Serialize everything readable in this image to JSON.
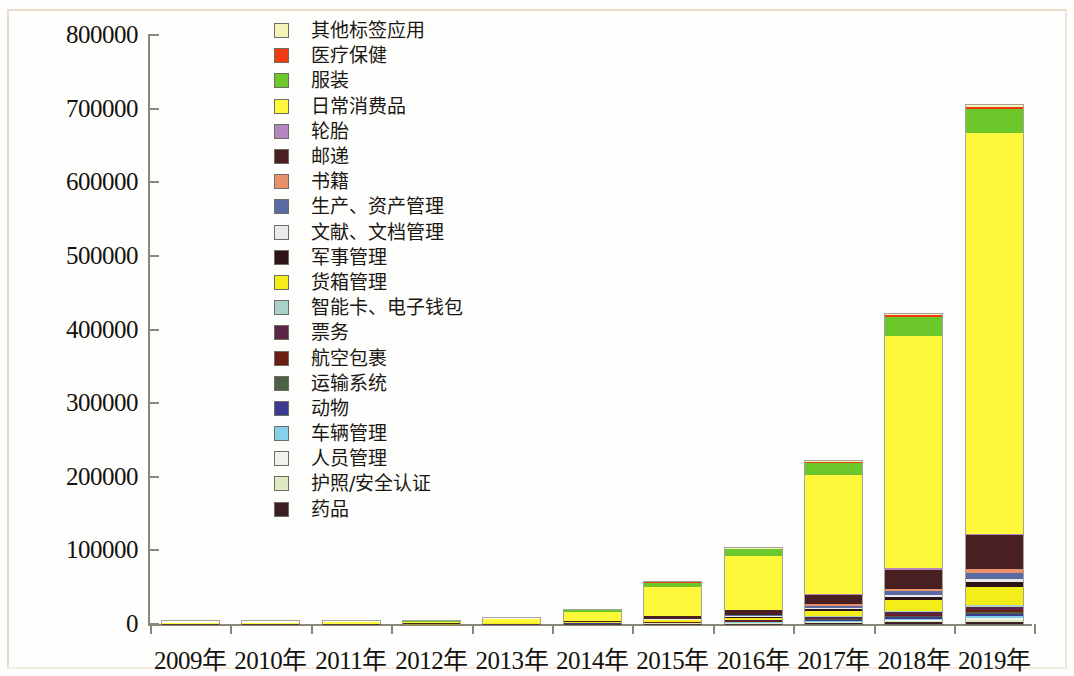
{
  "chart_data": {
    "type": "bar",
    "stacked": true,
    "title": "",
    "subtitle": "",
    "xlabel": "",
    "ylabel": "",
    "ylim": [
      0,
      800000
    ],
    "ytick_labels": [
      "0",
      "100000",
      "200000",
      "300000",
      "400000",
      "500000",
      "600000",
      "700000",
      "800000"
    ],
    "ytick_values": [
      0,
      100000,
      200000,
      300000,
      400000,
      500000,
      600000,
      700000,
      800000
    ],
    "grid": false,
    "legend_position": "inside-top-left",
    "categories": [
      "2009年",
      "2010年",
      "2011年",
      "2012年",
      "2013年",
      "2014年",
      "2015年",
      "2016年",
      "2017年",
      "2018年",
      "2019年"
    ],
    "totals": [
      2000,
      2300,
      3000,
      4200,
      7500,
      19000,
      57000,
      103000,
      221000,
      421000,
      705000
    ],
    "series": [
      {
        "name": "药品",
        "color": "#3b1f22",
        "values": [
          20,
          25,
          30,
          45,
          80,
          200,
          420,
          700,
          1300,
          2200,
          3200
        ]
      },
      {
        "name": "护照/安全认证",
        "color": "#dfe9c4",
        "values": [
          15,
          18,
          24,
          36,
          65,
          160,
          330,
          560,
          1050,
          1800,
          2600
        ]
      },
      {
        "name": "人员管理",
        "color": "#f2f2ec",
        "values": [
          15,
          18,
          24,
          36,
          65,
          160,
          330,
          560,
          1050,
          1800,
          2600
        ]
      },
      {
        "name": "车辆管理",
        "color": "#84d2ea",
        "values": [
          15,
          18,
          24,
          36,
          65,
          160,
          330,
          560,
          1050,
          1800,
          2600
        ]
      },
      {
        "name": "动物",
        "color": "#3b3a8f",
        "values": [
          15,
          18,
          24,
          36,
          65,
          160,
          330,
          560,
          1050,
          1800,
          2600
        ]
      },
      {
        "name": "运输系统",
        "color": "#4c6047",
        "values": [
          15,
          18,
          24,
          36,
          65,
          160,
          330,
          560,
          1050,
          1800,
          2600
        ]
      },
      {
        "name": "航空包裹",
        "color": "#6e1d12",
        "values": [
          15,
          18,
          24,
          36,
          65,
          160,
          330,
          560,
          1050,
          1800,
          2600
        ]
      },
      {
        "name": "票务",
        "color": "#5c2447",
        "values": [
          25,
          30,
          40,
          60,
          110,
          280,
          560,
          950,
          1900,
          3400,
          5200
        ]
      },
      {
        "name": "智能卡、电子钱包",
        "color": "#a9d2cb",
        "values": [
          15,
          18,
          24,
          36,
          65,
          160,
          330,
          560,
          1050,
          1800,
          2600
        ]
      },
      {
        "name": "货箱管理",
        "color": "#f3ee1a",
        "values": [
          60,
          70,
          95,
          140,
          260,
          650,
          1900,
          3500,
          7600,
          14500,
          24000
        ]
      },
      {
        "name": "军事管理",
        "color": "#2d1417",
        "values": [
          25,
          30,
          40,
          60,
          110,
          280,
          620,
          1100,
          2300,
          4200,
          6500
        ]
      },
      {
        "name": "文献、文档管理",
        "color": "#eaeaea",
        "values": [
          20,
          24,
          32,
          48,
          88,
          220,
          480,
          850,
          1800,
          3200,
          4800
        ]
      },
      {
        "name": "生产、资产管理",
        "color": "#5a6ba4",
        "values": [
          30,
          36,
          48,
          70,
          130,
          330,
          720,
          1300,
          2700,
          5000,
          7600
        ]
      },
      {
        "name": "书籍",
        "color": "#e9916b",
        "values": [
          25,
          30,
          40,
          58,
          105,
          270,
          590,
          1050,
          2200,
          4000,
          6200
        ]
      },
      {
        "name": "邮递",
        "color": "#4a1f22",
        "values": [
          120,
          140,
          190,
          280,
          520,
          1300,
          3400,
          6200,
          13000,
          26000,
          46000
        ]
      },
      {
        "name": "轮胎",
        "color": "#b386c0",
        "values": [
          10,
          12,
          16,
          24,
          44,
          110,
          240,
          420,
          880,
          1600,
          2400
        ]
      },
      {
        "name": "日常消费品",
        "color": "#fdf83a",
        "values": [
          1200,
          1400,
          1800,
          2500,
          4500,
          11500,
          40000,
          75000,
          165000,
          320000,
          550000
        ]
      },
      {
        "name": "服装",
        "color": "#6cc72b",
        "values": [
          260,
          300,
          400,
          560,
          1000,
          2500,
          5500,
          9000,
          16000,
          27000,
          33000
        ]
      },
      {
        "name": "医疗保健",
        "color": "#f03b12",
        "values": [
          15,
          18,
          24,
          36,
          65,
          160,
          330,
          560,
          1050,
          1800,
          2600
        ]
      },
      {
        "name": "其他标签应用",
        "color": "#f5f4bb",
        "values": [
          15,
          18,
          24,
          36,
          65,
          160,
          330,
          560,
          1050,
          1800,
          2600
        ]
      }
    ]
  },
  "axes": {
    "y_ticks": [
      {
        "label": "800000",
        "value": 800000
      },
      {
        "label": "700000",
        "value": 700000
      },
      {
        "label": "600000",
        "value": 600000
      },
      {
        "label": "500000",
        "value": 500000
      },
      {
        "label": "400000",
        "value": 400000
      },
      {
        "label": "300000",
        "value": 300000
      },
      {
        "label": "200000",
        "value": 200000
      },
      {
        "label": "100000",
        "value": 100000
      },
      {
        "label": "0",
        "value": 0
      }
    ]
  }
}
